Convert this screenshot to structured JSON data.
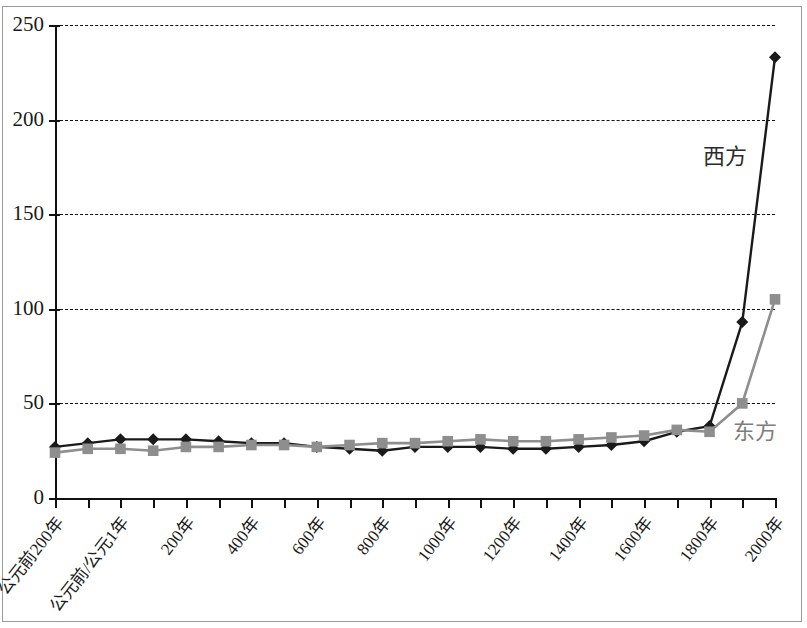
{
  "chart_data": {
    "type": "line",
    "title": "",
    "xlabel": "",
    "ylabel": "",
    "ylim": [
      0,
      250
    ],
    "yticks": [
      0,
      50,
      100,
      150,
      200,
      250
    ],
    "grid": true,
    "grid_style": "dashed-horizontal",
    "legend_position": "inline-annotation",
    "x": [
      "公元前200年",
      "公元前100年",
      "公元前/公元1年",
      "100年",
      "200年",
      "300年",
      "400年",
      "500年",
      "600年",
      "700年",
      "800年",
      "900年",
      "1000年",
      "1100年",
      "1200年",
      "1300年",
      "1400年",
      "1500年",
      "1600年",
      "1700年",
      "1800年",
      "1900年",
      "2000年"
    ],
    "xtick_labels_visible": [
      "公元前200年",
      "公元前/公元1年",
      "200年",
      "400年",
      "600年",
      "800年",
      "1000年",
      "1200年",
      "1400年",
      "1600年",
      "1800年",
      "2000年"
    ],
    "xtick_label_every": 2,
    "series": [
      {
        "name": "西方",
        "color": "#1a1a1a",
        "marker": "diamond",
        "values": [
          27,
          29,
          31,
          31,
          31,
          30,
          29,
          29,
          27,
          26,
          25,
          27,
          27,
          27,
          26,
          26,
          27,
          28,
          30,
          35,
          38,
          93,
          233
        ]
      },
      {
        "name": "东方",
        "color": "#8e8e8e",
        "marker": "square",
        "values": [
          24,
          26,
          26,
          25,
          27,
          27,
          28,
          28,
          27,
          28,
          29,
          29,
          30,
          31,
          30,
          30,
          31,
          32,
          33,
          36,
          35,
          50,
          105
        ]
      }
    ],
    "annotations": [
      {
        "text": "西方",
        "series": "西方",
        "x_px": 703,
        "y_px": 146
      },
      {
        "text": "东方",
        "series": "东方",
        "x_px": 733,
        "y_px": 421
      }
    ]
  }
}
